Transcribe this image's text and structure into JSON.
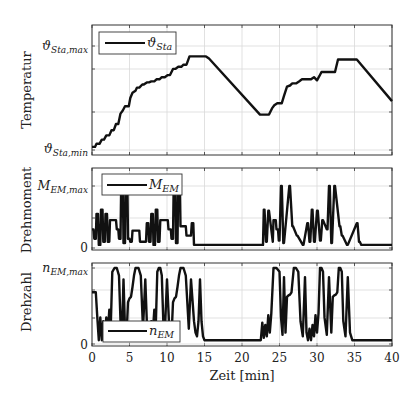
{
  "chart_data": [
    {
      "type": "line",
      "panel": "top",
      "ylabel": "Temperatur",
      "ytick_labels": {
        "min": {
          "base": "ϑ",
          "sub": "Sta,min"
        },
        "max": {
          "base": "ϑ",
          "sub": "Sta,max"
        }
      },
      "ylim_normalized": [
        0,
        1
      ],
      "legend": {
        "label_base": "ϑ",
        "label_sub": "Sta",
        "placement": "top-left"
      },
      "grid": true,
      "series": [
        {
          "name": "ϑ_Sta",
          "x": [
            0,
            0.4,
            0.6,
            1.0,
            1.3,
            1.6,
            1.9,
            2.3,
            2.6,
            2.9,
            3.2,
            3.5,
            3.8,
            4.1,
            4.4,
            4.9,
            5.1,
            5.4,
            5.8,
            6.0,
            6.3,
            6.7,
            6.9,
            7.3,
            7.6,
            7.9,
            8.3,
            8.6,
            9.0,
            9.3,
            9.7,
            10.1,
            10.4,
            10.8,
            11.1,
            11.5,
            11.9,
            12.2,
            12.6,
            13.0,
            13.4,
            14.0,
            15.2,
            15.6,
            22.4,
            23.2,
            23.6,
            24.0,
            24.3,
            24.7,
            25.3,
            25.6,
            26.0,
            26.4,
            26.7,
            27.2,
            27.6,
            28.0,
            29.2,
            29.6,
            30.0,
            30.3,
            30.6,
            31.0,
            31.3,
            32.4,
            32.8,
            34.8,
            35.3,
            40.0
          ],
          "y": [
            0.03,
            0.03,
            0.06,
            0.06,
            0.1,
            0.1,
            0.14,
            0.14,
            0.19,
            0.19,
            0.25,
            0.25,
            0.35,
            0.38,
            0.42,
            0.42,
            0.5,
            0.55,
            0.57,
            0.6,
            0.6,
            0.63,
            0.63,
            0.65,
            0.65,
            0.66,
            0.66,
            0.68,
            0.68,
            0.7,
            0.7,
            0.72,
            0.72,
            0.78,
            0.78,
            0.8,
            0.8,
            0.82,
            0.82,
            0.9,
            0.9,
            0.9,
            0.9,
            0.88,
            0.34,
            0.34,
            0.34,
            0.4,
            0.43,
            0.45,
            0.45,
            0.52,
            0.61,
            0.62,
            0.64,
            0.64,
            0.66,
            0.68,
            0.68,
            0.7,
            0.67,
            0.71,
            0.75,
            0.75,
            0.75,
            0.75,
            0.87,
            0.87,
            0.87,
            0.47
          ]
        }
      ]
    },
    {
      "type": "line",
      "panel": "middle",
      "ylabel": "Drehmoment",
      "ytick_labels": {
        "zero": "0",
        "max": {
          "base": "M",
          "sub": "EM,max"
        }
      },
      "ylim_normalized": [
        0,
        1.2
      ],
      "legend": {
        "label_base": "M",
        "label_sub": "EM",
        "placement": "top-left"
      },
      "grid": true,
      "series": [
        {
          "name": "M_EM",
          "x": [
            0,
            0.2,
            0.3,
            0.5,
            0.6,
            0.8,
            0.9,
            1.1,
            1.2,
            1.4,
            1.5,
            1.7,
            1.8,
            2.0,
            2.1,
            2.3,
            2.4,
            3.2,
            3.3,
            3.5,
            3.6,
            3.8,
            3.9,
            4.1,
            4.2,
            4.4,
            4.5,
            4.7,
            4.8,
            5.0,
            5.1,
            5.3,
            5.4,
            5.6,
            6.3,
            6.4,
            7.2,
            7.3,
            7.5,
            7.6,
            7.8,
            7.9,
            8.1,
            8.2,
            8.4,
            8.5,
            8.7,
            8.8,
            9.0,
            9.1,
            9.3,
            10.1,
            10.2,
            10.5,
            10.6,
            10.8,
            10.9,
            11.1,
            11.2,
            11.4,
            11.5,
            11.7,
            11.8,
            12.5,
            12.6,
            13.2,
            13.3,
            13.5,
            13.6,
            14.8,
            22.8,
            22.9,
            23.0,
            23.2,
            23.3,
            23.5,
            23.6,
            24.1,
            24.2,
            24.5,
            24.6,
            24.8,
            24.9,
            25.0,
            25.2,
            25.3,
            25.5,
            25.6,
            26.3,
            26.4,
            26.7,
            26.8,
            27.3,
            27.4,
            28.1,
            28.2,
            28.7,
            28.8,
            29.0,
            29.1,
            29.3,
            29.4,
            29.6,
            29.7,
            30.0,
            30.1,
            30.4,
            30.5,
            30.7,
            30.8,
            31.3,
            31.4,
            31.6,
            31.7,
            31.9,
            32.0,
            32.3,
            32.4,
            33.0,
            33.1,
            33.3,
            33.4,
            34.0,
            34.1,
            35.3,
            35.4,
            35.6,
            35.7,
            35.9,
            36.0,
            36.3,
            36.4,
            40.0
          ],
          "y": [
            0.3,
            0.3,
            0.15,
            0.15,
            0.55,
            0.55,
            0.05,
            0.05,
            0.62,
            0.62,
            0.1,
            0.1,
            0.55,
            0.55,
            0.1,
            0.1,
            0.45,
            0.45,
            0.3,
            0.3,
            0.15,
            0.15,
            1.15,
            1.15,
            0.08,
            0.08,
            1.15,
            1.15,
            0.15,
            0.15,
            0.1,
            0.1,
            0.28,
            0.28,
            0.28,
            0.1,
            0.1,
            0.4,
            0.4,
            0.1,
            0.1,
            0.55,
            0.55,
            0.05,
            0.05,
            0.62,
            0.62,
            0.1,
            0.1,
            0.45,
            0.45,
            0.45,
            0.3,
            0.3,
            0.15,
            0.15,
            1.15,
            1.15,
            0.08,
            0.08,
            1.15,
            1.15,
            0.35,
            0.35,
            0.2,
            0.2,
            0.4,
            0.4,
            0.05,
            0.05,
            0.05,
            0.62,
            0.62,
            0.1,
            0.1,
            0.6,
            0.6,
            0.1,
            0.45,
            0.45,
            0.3,
            0.3,
            0.12,
            0.12,
            1.0,
            1.0,
            0.08,
            0.08,
            1.0,
            1.0,
            0.35,
            0.35,
            0.2,
            0.2,
            0.05,
            0.05,
            0.4,
            0.4,
            0.1,
            0.1,
            0.62,
            0.62,
            0.1,
            0.1,
            0.6,
            0.6,
            0.12,
            0.12,
            0.45,
            0.45,
            0.3,
            0.3,
            1.0,
            1.0,
            0.08,
            0.08,
            1.0,
            1.0,
            0.35,
            0.35,
            0.2,
            0.2,
            0.05,
            0.05,
            0.4,
            0.4,
            0.1,
            0.1,
            0.05,
            0.05,
            0.05,
            0.05,
            0.05
          ]
        }
      ]
    },
    {
      "type": "line",
      "panel": "bottom",
      "ylabel": "Drehzahl",
      "xlabel": "Zeit [min]",
      "ytick_labels": {
        "zero": "0",
        "max": {
          "base": "n",
          "sub": "EM,max"
        }
      },
      "ylim_normalized": [
        0,
        1
      ],
      "xlim": [
        0,
        40
      ],
      "xticks": [
        0,
        5,
        10,
        15,
        20,
        25,
        30,
        35,
        40
      ],
      "legend": {
        "label_base": "n",
        "label_sub": "EM",
        "placement": "bottom-left"
      },
      "grid": true,
      "series": [
        {
          "name": "n_EM",
          "x": [
            0,
            0.5,
            0.7,
            0.9,
            1.1,
            1.3,
            1.5,
            1.7,
            1.9,
            2.1,
            2.3,
            2.5,
            2.7,
            3.0,
            3.3,
            3.6,
            3.8,
            4.0,
            4.2,
            4.4,
            4.6,
            4.8,
            5.0,
            5.2,
            5.4,
            5.6,
            5.8,
            6.0,
            6.2,
            6.5,
            6.8,
            7.1,
            7.3,
            7.5,
            7.7,
            7.9,
            8.1,
            8.3,
            8.5,
            8.7,
            8.9,
            9.1,
            9.3,
            9.5,
            9.7,
            10.0,
            10.3,
            10.6,
            10.8,
            11.0,
            11.2,
            11.4,
            11.6,
            11.8,
            12.0,
            12.2,
            12.5,
            12.9,
            13.2,
            13.6,
            13.8,
            14.0,
            14.2,
            14.4,
            14.6,
            14.8,
            15.0,
            15.3,
            22.2,
            22.5,
            22.7,
            22.9,
            23.1,
            23.3,
            23.5,
            23.7,
            23.9,
            24.2,
            24.6,
            25.0,
            25.2,
            25.4,
            25.6,
            25.8,
            26.0,
            26.2,
            26.4,
            26.6,
            26.9,
            27.2,
            27.5,
            27.8,
            28.1,
            28.4,
            28.6,
            28.8,
            29.0,
            29.2,
            29.4,
            29.6,
            29.8,
            30.0,
            30.2,
            30.4,
            30.6,
            30.8,
            31.0,
            31.3,
            31.6,
            31.9,
            32.1,
            32.3,
            32.5,
            32.7,
            32.9,
            33.1,
            33.3,
            33.5,
            33.8,
            34.1,
            34.4,
            34.7,
            35.0,
            35.3,
            35.6,
            35.8,
            36.0,
            36.2,
            36.4,
            36.6,
            36.8,
            37.0,
            40.0
          ],
          "y": [
            0.68,
            0.68,
            0.35,
            0.05,
            0.35,
            0.05,
            0.3,
            0.1,
            0.35,
            0.15,
            0.45,
            0.25,
            0.95,
            1.0,
            1.0,
            0.9,
            0.3,
            0.15,
            0.85,
            0.2,
            0.1,
            0.55,
            0.6,
            0.62,
            0.75,
            0.9,
            1.0,
            1.0,
            1.0,
            0.9,
            0.2,
            0.85,
            0.3,
            0.15,
            0.1,
            0.3,
            0.15,
            0.45,
            0.25,
            0.95,
            1.0,
            1.0,
            0.9,
            0.3,
            0.15,
            0.85,
            0.2,
            0.1,
            0.55,
            0.6,
            0.62,
            0.75,
            0.9,
            1.0,
            1.0,
            1.0,
            0.9,
            0.2,
            0.85,
            0.3,
            0.15,
            0.1,
            0.3,
            0.85,
            0.3,
            0.1,
            0.05,
            0.05,
            0.05,
            0.05,
            0.28,
            0.08,
            0.25,
            0.1,
            0.38,
            0.15,
            0.4,
            1.0,
            1.0,
            0.95,
            0.35,
            0.12,
            0.88,
            0.15,
            0.62,
            0.64,
            0.65,
            0.68,
            1.0,
            1.0,
            0.95,
            0.3,
            0.1,
            0.88,
            0.15,
            0.05,
            0.2,
            0.05,
            0.25,
            0.1,
            0.38,
            0.15,
            0.4,
            1.0,
            1.0,
            0.95,
            0.35,
            0.12,
            0.88,
            0.15,
            0.62,
            0.64,
            0.65,
            0.68,
            1.0,
            1.0,
            0.95,
            0.3,
            0.1,
            0.88,
            0.15,
            0.05,
            0.05,
            0.05,
            0.05,
            0.05,
            0.05,
            0.05,
            0.05,
            0.05,
            0.05,
            0.05,
            0.05
          ]
        }
      ]
    }
  ]
}
